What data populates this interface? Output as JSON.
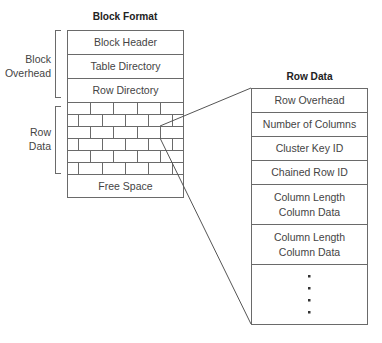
{
  "block_format": {
    "title": "Block Format",
    "overhead_label_line1": "Block",
    "overhead_label_line2": "Overhead",
    "row_data_label_line1": "Row",
    "row_data_label_line2": "Data",
    "sections": [
      {
        "label": "Block Header"
      },
      {
        "label": "Table Directory"
      },
      {
        "label": "Row Directory"
      }
    ],
    "brick_rows": 6,
    "free_space_label": "Free Space"
  },
  "row_data": {
    "title": "Row Data",
    "fields": [
      {
        "label": "Row Overhead"
      },
      {
        "label": "Number of Columns"
      },
      {
        "label": "Cluster Key ID"
      },
      {
        "label": "Chained Row ID"
      },
      {
        "line1": "Column Length",
        "line2": "Column Data"
      },
      {
        "line1": "Column Length",
        "line2": "Column Data"
      }
    ],
    "continuation": "ellipsis-dots"
  },
  "colors": {
    "line": "#6a6a6a",
    "text": "#444444",
    "title": "#222222"
  }
}
